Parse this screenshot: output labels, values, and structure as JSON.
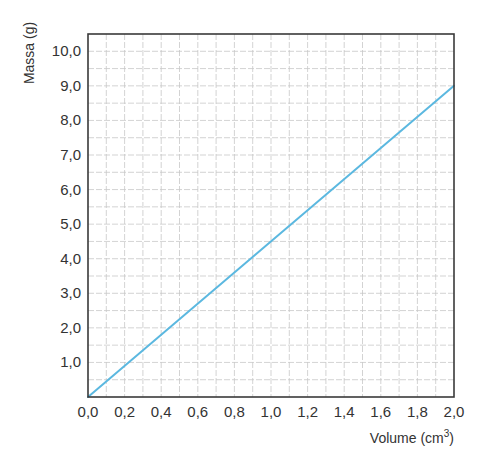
{
  "chart_data": {
    "type": "line",
    "title": "",
    "xlabel": "Volume (cm³)",
    "xlabel_base": "Volume (cm",
    "xlabel_sup": "3",
    "xlabel_close": ")",
    "ylabel": "Massa (g)",
    "xlim": [
      0.0,
      2.0
    ],
    "ylim": [
      0.0,
      10.5
    ],
    "x_ticks": [
      "0,0",
      "0,2",
      "0,4",
      "0,6",
      "0,8",
      "1,0",
      "1,2",
      "1,4",
      "1,6",
      "1,8",
      "2,0"
    ],
    "y_ticks": [
      "1,0",
      "2,0",
      "3,0",
      "4,0",
      "5,0",
      "6,0",
      "7,0",
      "8,0",
      "9,0",
      "10,0"
    ],
    "x_tick_values": [
      0.0,
      0.2,
      0.4,
      0.6,
      0.8,
      1.0,
      1.2,
      1.4,
      1.6,
      1.8,
      2.0
    ],
    "y_tick_values": [
      1.0,
      2.0,
      3.0,
      4.0,
      5.0,
      6.0,
      7.0,
      8.0,
      9.0,
      10.0
    ],
    "grid": true,
    "grid_minor_x_step": 0.1,
    "grid_minor_y_step": 0.5,
    "legend": null,
    "series": [
      {
        "name": "Massa vs Volume",
        "color": "#5bb8e0",
        "x": [
          0.0,
          2.0
        ],
        "y": [
          0.0,
          9.0
        ]
      }
    ]
  },
  "colors": {
    "frame": "#3a3a3a",
    "grid": "#c8c8c8",
    "line": "#5bb8e0"
  }
}
